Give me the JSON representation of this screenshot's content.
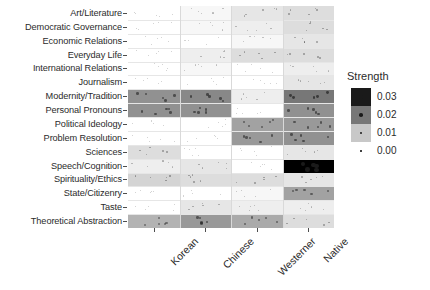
{
  "chart_data": {
    "type": "heatmap",
    "title": "",
    "xlabel": "",
    "ylabel": "",
    "legend_title": "Strength",
    "legend_position": "right",
    "grid": true,
    "columns": [
      "Korean",
      "Chinese",
      "Westerner",
      "Native"
    ],
    "rows": [
      "Art/Literature",
      "Democratic Governance",
      "Economic Relations",
      "Everyday Life",
      "International Relations",
      "Journalism",
      "Modernity/Tradition",
      "Personal Pronouns",
      "Political Ideology",
      "Problem Resolution",
      "Sciences",
      "Speech/Cognition",
      "Spirituality/Ethics",
      "State/Citizenry",
      "Taste",
      "Theoretical Abstraction"
    ],
    "legend_breaks": [
      {
        "value": "0.03",
        "color": "#1a1a1a"
      },
      {
        "value": "0.02",
        "color": "#777777"
      },
      {
        "value": "0.01",
        "color": "#c8c8c8"
      },
      {
        "value": "0.00",
        "color": "#ffffff"
      }
    ],
    "zlim": [
      0.0,
      0.03
    ],
    "color_low": "#ffffff",
    "color_high": "#000000",
    "values": [
      [
        0.0,
        0.001,
        0.003,
        0.004
      ],
      [
        0.0,
        0.001,
        0.002,
        0.004
      ],
      [
        0.0,
        0.0,
        0.001,
        0.003
      ],
      [
        0.0,
        0.002,
        0.004,
        0.004
      ],
      [
        0.0,
        0.001,
        0.0,
        0.002
      ],
      [
        0.0,
        0.0,
        0.0,
        0.003
      ],
      [
        0.013,
        0.014,
        0.002,
        0.016
      ],
      [
        0.013,
        0.013,
        0.0,
        0.013
      ],
      [
        0.0,
        0.0,
        0.011,
        0.012
      ],
      [
        0.0,
        0.0,
        0.012,
        0.013
      ],
      [
        0.004,
        0.0,
        0.0,
        0.003
      ],
      [
        0.002,
        0.003,
        0.0,
        0.03
      ],
      [
        0.005,
        0.004,
        0.004,
        0.003
      ],
      [
        0.0,
        0.0,
        0.001,
        0.011
      ],
      [
        0.0,
        0.003,
        0.002,
        0.002
      ],
      [
        0.009,
        0.012,
        0.01,
        0.004
      ]
    ]
  }
}
